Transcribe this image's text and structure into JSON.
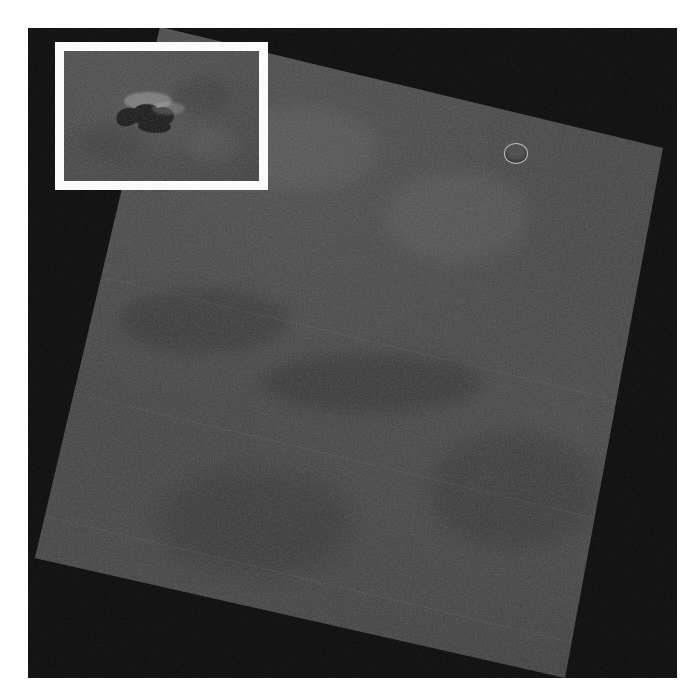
{
  "page": {
    "background_color": "#ffffff",
    "width": 699,
    "height": 699
  },
  "image_frame": {
    "backdrop_color": "#0a0a0a",
    "left": 28,
    "top": 28,
    "width": 649,
    "height": 650
  },
  "swath": {
    "name": "rotated-image-swath",
    "base_color": "#434343",
    "rotation_degrees": 13.5,
    "corners": [
      [
        160,
        27
      ],
      [
        663,
        148
      ],
      [
        565,
        678
      ],
      [
        35,
        558
      ]
    ],
    "seam_lines": 3,
    "texture": "grainy-noise"
  },
  "crater": {
    "name": "circular-crater",
    "center_x": 515,
    "center_y": 152,
    "diameter": 22,
    "outline_color": "#bebebe"
  },
  "inset": {
    "name": "inset-callout",
    "border_color": "#fbfbfb",
    "border_width": 9,
    "left": 55,
    "top": 42,
    "width": 213,
    "height": 148,
    "interior_color": "#464646",
    "feature": {
      "name": "dark-surface-feature",
      "color": "#131313",
      "description": "elongated dark ridge-and-hollow formation"
    }
  },
  "accessible": {
    "alt_text": "Grayscale orbital image of a planetary surface shown as a rotated rectangular swath on a black background, with a white-bordered inset box magnifying a dark elongated surface feature in the upper left."
  }
}
